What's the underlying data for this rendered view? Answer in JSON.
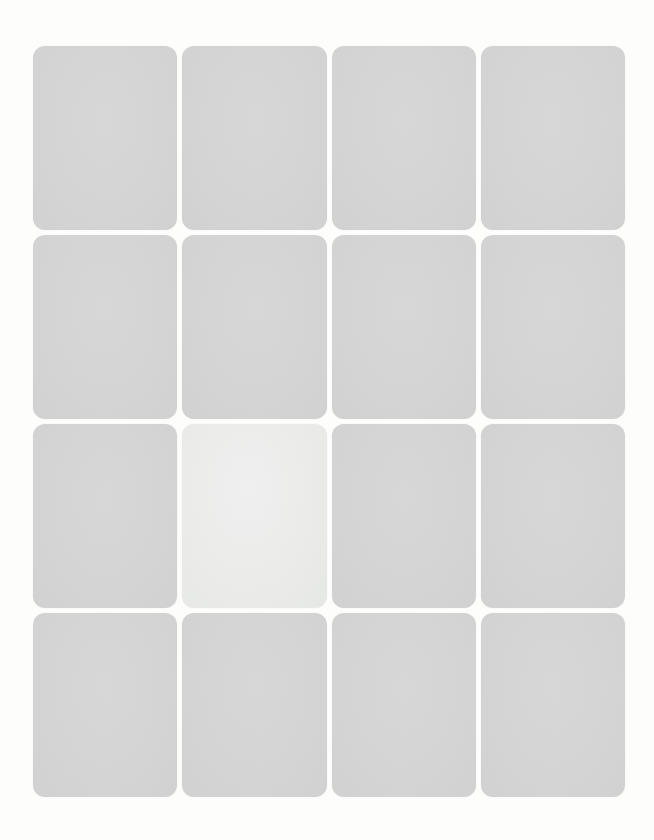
{
  "board": {
    "rows": 4,
    "cols": 4,
    "face_down_count": 15,
    "face_up_count": 1,
    "cards": [
      {
        "id": 1,
        "row": 1,
        "col": 1,
        "state": "face-down"
      },
      {
        "id": 2,
        "row": 1,
        "col": 2,
        "state": "face-down"
      },
      {
        "id": 3,
        "row": 1,
        "col": 3,
        "state": "face-down"
      },
      {
        "id": 4,
        "row": 1,
        "col": 4,
        "state": "face-down"
      },
      {
        "id": 5,
        "row": 2,
        "col": 1,
        "state": "face-down"
      },
      {
        "id": 6,
        "row": 2,
        "col": 2,
        "state": "face-down"
      },
      {
        "id": 7,
        "row": 2,
        "col": 3,
        "state": "face-down"
      },
      {
        "id": 8,
        "row": 2,
        "col": 4,
        "state": "face-down"
      },
      {
        "id": 9,
        "row": 3,
        "col": 1,
        "state": "face-down"
      },
      {
        "id": 10,
        "row": 3,
        "col": 2,
        "state": "face-up"
      },
      {
        "id": 11,
        "row": 3,
        "col": 3,
        "state": "face-down"
      },
      {
        "id": 12,
        "row": 3,
        "col": 4,
        "state": "face-down"
      },
      {
        "id": 13,
        "row": 4,
        "col": 1,
        "state": "face-down"
      },
      {
        "id": 14,
        "row": 4,
        "col": 2,
        "state": "face-down"
      },
      {
        "id": 15,
        "row": 4,
        "col": 3,
        "state": "face-down"
      },
      {
        "id": 16,
        "row": 4,
        "col": 4,
        "state": "face-down"
      }
    ]
  },
  "colors": {
    "background": "#fdfdfc",
    "card_back": "#d4d5d4",
    "card_face": "#ebecea"
  }
}
